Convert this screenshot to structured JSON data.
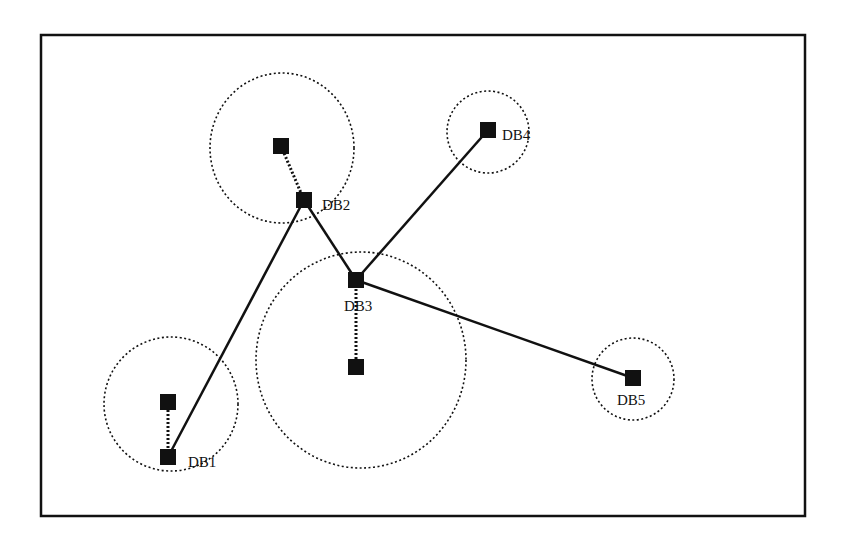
{
  "diagram": {
    "type": "network-topology",
    "frame": {
      "x": 41,
      "y": 35,
      "width": 764,
      "height": 481
    },
    "colors": {
      "stroke": "#111111",
      "node": "#111111",
      "background": "#ffffff"
    },
    "clusters": [
      {
        "id": "c1",
        "cx": 171,
        "cy": 404,
        "r": 67
      },
      {
        "id": "c2",
        "cx": 282,
        "cy": 148,
        "r": 73
      },
      {
        "id": "c3",
        "cx": 361,
        "cy": 360,
        "r": 106
      },
      {
        "id": "c4",
        "cx": 488,
        "cy": 132,
        "r": 41
      },
      {
        "id": "c5",
        "cx": 633,
        "cy": 379,
        "r": 41
      }
    ],
    "nodes": [
      {
        "id": "DB1",
        "label": "DB1",
        "x": 168,
        "y": 457,
        "label_x": 188,
        "label_y": 467
      },
      {
        "id": "DB2",
        "label": "DB2",
        "x": 304,
        "y": 200,
        "label_x": 322,
        "label_y": 210
      },
      {
        "id": "DB3",
        "label": "DB3",
        "x": 356,
        "y": 280,
        "label_x": 344,
        "label_y": 311
      },
      {
        "id": "DB4",
        "label": "DB4",
        "x": 488,
        "y": 130,
        "label_x": 502,
        "label_y": 140
      },
      {
        "id": "DB5",
        "label": "DB5",
        "x": 633,
        "y": 378,
        "label_x": 617,
        "label_y": 405
      },
      {
        "id": "n1",
        "label": "",
        "x": 168,
        "y": 402
      },
      {
        "id": "n2",
        "label": "",
        "x": 281,
        "y": 146
      },
      {
        "id": "n3",
        "label": "",
        "x": 356,
        "y": 367
      }
    ],
    "solid_links": [
      {
        "from": "DB1",
        "to": "DB2"
      },
      {
        "from": "DB2",
        "to": "DB3"
      },
      {
        "from": "DB3",
        "to": "DB4"
      },
      {
        "from": "DB3",
        "to": "DB5"
      }
    ],
    "dotted_links": [
      {
        "from": "n1",
        "to": "DB1"
      },
      {
        "from": "n2",
        "to": "DB2"
      },
      {
        "from": "n3",
        "to": "DB3"
      }
    ],
    "labels": {
      "db1": "DB1",
      "db2": "DB2",
      "db3": "DB3",
      "db4": "DB4",
      "db5": "DB5"
    }
  }
}
